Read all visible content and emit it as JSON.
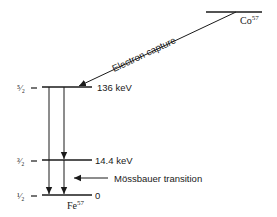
{
  "colors": {
    "ink": "#1a1a1a",
    "background": "#ffffff"
  },
  "parent": {
    "label_base": "Co",
    "label_mass": "57"
  },
  "electron_capture": {
    "label": "Electron capture"
  },
  "levels": [
    {
      "spin": "⁵⁄₂",
      "spin_text": "5/2",
      "energy": "136 keV"
    },
    {
      "spin": "³⁄₂",
      "spin_text": "3/2",
      "energy": "14.4 keV"
    },
    {
      "spin": "¹⁄₂",
      "spin_text": "1/2",
      "energy": "0"
    }
  ],
  "daughter": {
    "label_base": "Fe",
    "label_mass": "57"
  },
  "mossbauer": {
    "label": "Mössbauer transition"
  }
}
